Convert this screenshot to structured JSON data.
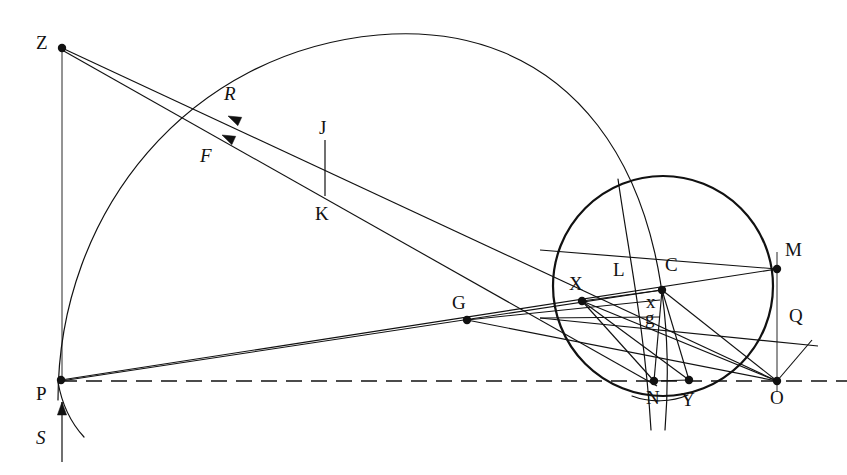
{
  "figure": {
    "width": 847,
    "height": 475,
    "background_color": "#ffffff",
    "stroke_color": "#111111"
  },
  "labels": [
    {
      "name": "label-Z",
      "text": "Z",
      "x": 36,
      "y": 33,
      "style": "upright"
    },
    {
      "name": "label-R",
      "text": "R",
      "x": 224,
      "y": 84,
      "style": "italic"
    },
    {
      "name": "label-J",
      "text": "J",
      "x": 319,
      "y": 118,
      "style": "upright"
    },
    {
      "name": "label-F",
      "text": "F",
      "x": 200,
      "y": 146,
      "style": "italic"
    },
    {
      "name": "label-K",
      "text": "K",
      "x": 315,
      "y": 204,
      "style": "upright"
    },
    {
      "name": "label-M",
      "text": "M",
      "x": 785,
      "y": 240,
      "style": "upright"
    },
    {
      "name": "label-L",
      "text": "L",
      "x": 613,
      "y": 260,
      "style": "upright"
    },
    {
      "name": "label-C",
      "text": "C",
      "x": 665,
      "y": 255,
      "style": "upright"
    },
    {
      "name": "label-X",
      "text": "X",
      "x": 569,
      "y": 274,
      "style": "upright"
    },
    {
      "name": "label-G",
      "text": "G",
      "x": 452,
      "y": 293,
      "style": "upright"
    },
    {
      "name": "label-x",
      "text": "x",
      "x": 646,
      "y": 292,
      "style": "upright"
    },
    {
      "name": "label-Q",
      "text": "Q",
      "x": 789,
      "y": 306,
      "style": "upright"
    },
    {
      "name": "label-g",
      "text": "g",
      "x": 645,
      "y": 308,
      "style": "upright"
    },
    {
      "name": "label-P",
      "text": "P",
      "x": 36,
      "y": 384,
      "style": "upright"
    },
    {
      "name": "label-N",
      "text": "N",
      "x": 646,
      "y": 388,
      "style": "upright"
    },
    {
      "name": "label-Y",
      "text": "Y",
      "x": 681,
      "y": 390,
      "style": "upright"
    },
    {
      "name": "label-O",
      "text": "O",
      "x": 770,
      "y": 388,
      "style": "upright"
    },
    {
      "name": "label-S",
      "text": "S",
      "x": 36,
      "y": 428,
      "style": "italic"
    }
  ],
  "points": [
    {
      "name": "point-Z",
      "label": "Z",
      "x": 62,
      "y": 48,
      "marked": true
    },
    {
      "name": "point-J",
      "label": "J",
      "x": 325,
      "y": 140,
      "marked": false
    },
    {
      "name": "point-K",
      "label": "K",
      "x": 325,
      "y": 196,
      "marked": false
    },
    {
      "name": "point-M",
      "label": "M",
      "x": 777,
      "y": 269,
      "marked": true
    },
    {
      "name": "point-C",
      "label": "C",
      "x": 662,
      "y": 290,
      "marked": true
    },
    {
      "name": "point-X",
      "label": "X",
      "x": 582,
      "y": 301,
      "marked": true
    },
    {
      "name": "point-G",
      "label": "G",
      "x": 467,
      "y": 320,
      "marked": true
    },
    {
      "name": "point-P",
      "label": "P",
      "x": 61,
      "y": 380,
      "marked": true
    },
    {
      "name": "point-N",
      "label": "N",
      "x": 654,
      "y": 381,
      "marked": true
    },
    {
      "name": "point-Y",
      "label": "Y",
      "x": 689,
      "y": 380,
      "marked": true
    },
    {
      "name": "point-O",
      "label": "O",
      "x": 777,
      "y": 381,
      "marked": true
    }
  ],
  "circle": {
    "name": "main-circle",
    "center_x": 663,
    "center_y": 286,
    "radius": 110,
    "stroke_width": 2.2
  },
  "arcs": [
    {
      "name": "large-outer-arc",
      "description": "large arc from P up over the top and down through the circle to below N",
      "path": "M 58 400 C 58 210 190 52 378 35 C 560 19 686 160 665 430",
      "stroke_width": 1.2
    },
    {
      "name": "circle-chord-arc",
      "description": "secondary arc passing through the circle from upper-left to N",
      "path": "M 618 179 C 628 250 645 330 651 430",
      "stroke_width": 1.2
    },
    {
      "name": "lower-left-small-arc",
      "description": "short arc tail below P",
      "path": "M 58 382 C 62 405 72 424 84 437",
      "stroke_width": 1.2
    },
    {
      "name": "arc-near-N-bottom",
      "description": "faint arc segment below N to Y",
      "path": "M 632 396 C 650 403 672 402 688 395",
      "stroke_width": 1.2
    }
  ],
  "rays": [
    {
      "name": "ray-Z-to-O",
      "from": "Z",
      "to": "O",
      "x1": 62,
      "y1": 48,
      "x2": 777,
      "y2": 381
    },
    {
      "name": "ray-Z-to-N",
      "from": "Z",
      "to": "N",
      "x1": 62,
      "y1": 50,
      "x2": 657,
      "y2": 386
    },
    {
      "name": "ray-P-to-M",
      "from": "P",
      "to": "M",
      "x1": 61,
      "y1": 380,
      "x2": 777,
      "y2": 269
    },
    {
      "name": "ray-P-to-X",
      "from": "P",
      "to": "X",
      "x1": 61,
      "y1": 381,
      "x2": 662,
      "y2": 290
    },
    {
      "name": "ray-C-to-O",
      "from": "C",
      "to": "O",
      "x1": 662,
      "y1": 290,
      "x2": 777,
      "y2": 381
    },
    {
      "name": "ray-C-to-N",
      "from": "C",
      "to": "N",
      "x1": 662,
      "y1": 290,
      "x2": 654,
      "y2": 381
    },
    {
      "name": "ray-C-to-Y",
      "from": "C",
      "to": "Y",
      "x1": 662,
      "y1": 290,
      "x2": 689,
      "y2": 380
    },
    {
      "name": "ray-X-to-O",
      "from": "X",
      "to": "O",
      "x1": 582,
      "y1": 301,
      "x2": 777,
      "y2": 381
    },
    {
      "name": "ray-X-to-N",
      "from": "X",
      "to": "N",
      "x1": 582,
      "y1": 301,
      "x2": 654,
      "y2": 381
    },
    {
      "name": "ray-X-to-Y",
      "from": "X",
      "to": "Y",
      "x1": 582,
      "y1": 301,
      "x2": 689,
      "y2": 380
    },
    {
      "name": "ray-N-to-Y",
      "from": "N",
      "to": "Y",
      "x1": 654,
      "y1": 381,
      "x2": 689,
      "y2": 380
    },
    {
      "name": "ray-X-to-C",
      "from": "X",
      "to": "C",
      "x1": 582,
      "y1": 301,
      "x2": 662,
      "y2": 290
    },
    {
      "name": "ray-G-to-x",
      "from": "G",
      "to": "x",
      "x1": 467,
      "y1": 320,
      "x2": 660,
      "y2": 300
    },
    {
      "name": "ray-G-to-O",
      "from": "G",
      "to": "O",
      "x1": 467,
      "y1": 320,
      "x2": 777,
      "y2": 381
    },
    {
      "name": "ray-left-to-g",
      "from": "left-edge",
      "to": "g",
      "x1": 540,
      "y1": 318,
      "x2": 660,
      "y2": 317
    },
    {
      "name": "ray-Q-line",
      "from": "left",
      "to": "Q",
      "x1": 540,
      "y1": 318,
      "x2": 818,
      "y2": 346
    },
    {
      "name": "ray-O-to-Q",
      "from": "O",
      "to": "Q",
      "x1": 777,
      "y1": 381,
      "x2": 812,
      "y2": 340
    },
    {
      "name": "ray-upper-through-C",
      "from": "upper-left",
      "to": "right",
      "x1": 540,
      "y1": 250,
      "x2": 777,
      "y2": 269
    }
  ],
  "segments": [
    {
      "name": "segment-J-K",
      "x1": 325,
      "y1": 140,
      "x2": 325,
      "y2": 196,
      "stroke_width": 1.2
    },
    {
      "name": "segment-Z-vertical",
      "x1": 62,
      "y1": 48,
      "x2": 62,
      "y2": 382,
      "stroke_width": 0.9
    },
    {
      "name": "segment-M-O-vertical",
      "x1": 777,
      "y1": 252,
      "x2": 777,
      "y2": 392,
      "stroke_width": 0.9
    },
    {
      "name": "segment-S-arrow",
      "x1": 62,
      "y1": 462,
      "x2": 62,
      "y2": 402,
      "stroke_width": 1.2
    }
  ],
  "dashed_baseline": {
    "name": "optical-axis-dashed",
    "x1": 61,
    "y1": 381,
    "x2": 847,
    "y2": 381,
    "dash_pattern": "16 9"
  },
  "arrows": [
    {
      "name": "arrow-R",
      "label": "R",
      "tip_x": 228,
      "tip_y": 116,
      "angle_deg": 205
    },
    {
      "name": "arrow-F",
      "label": "F",
      "tip_x": 222,
      "tip_y": 135,
      "angle_deg": 205
    },
    {
      "name": "arrow-S",
      "label": "S",
      "tip_x": 62,
      "tip_y": 402,
      "angle_deg": 270
    }
  ]
}
